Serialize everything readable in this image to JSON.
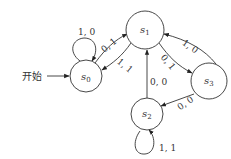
{
  "diagram": {
    "type": "state-transition",
    "start_label": "开始",
    "states": [
      {
        "id": "s0",
        "base": "s",
        "sub": "0"
      },
      {
        "id": "s1",
        "base": "s",
        "sub": "1"
      },
      {
        "id": "s2",
        "base": "s",
        "sub": "2"
      },
      {
        "id": "s3",
        "base": "s",
        "sub": "3"
      }
    ],
    "transitions": [
      {
        "from": "s0",
        "to": "s0",
        "label": "1, 0"
      },
      {
        "from": "s0",
        "to": "s1",
        "label": "0, 1"
      },
      {
        "from": "s1",
        "to": "s0",
        "label": "1, 1"
      },
      {
        "from": "s1",
        "to": "s3",
        "label": "0, 1"
      },
      {
        "from": "s3",
        "to": "s1",
        "label": "1, 0"
      },
      {
        "from": "s3",
        "to": "s2",
        "label": "0, 0"
      },
      {
        "from": "s2",
        "to": "s1",
        "label": "0, 0"
      },
      {
        "from": "s2",
        "to": "s2",
        "label": "1, 1"
      }
    ]
  }
}
